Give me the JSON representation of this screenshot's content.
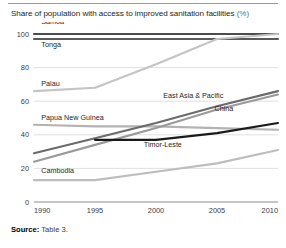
{
  "chart_data": {
    "type": "line",
    "title": "Share of population with access to improved sanitation facilities",
    "title_unit": "(%)",
    "xlabel": "",
    "ylabel": "",
    "xlim": [
      1990,
      2010
    ],
    "ylim": [
      0,
      100
    ],
    "xticks": [
      "1990",
      "1995",
      "2000",
      "2005",
      "2010"
    ],
    "yticks": [
      "0",
      "20",
      "40",
      "60",
      "80",
      "100"
    ],
    "grid": true,
    "legend_position": "inline-labels",
    "source": "Table 3.",
    "source_label": "Source:",
    "x": [
      1990,
      1995,
      2000,
      2005,
      2010
    ],
    "series": [
      {
        "name": "Samoa",
        "color": "#4c4c4c",
        "width": 2.1,
        "label_x": 1990.6,
        "label_y": 106,
        "values": [
          100,
          100,
          100,
          100,
          100
        ]
      },
      {
        "name": "Tonga",
        "color": "#5a5a5a",
        "width": 2.1,
        "label_x": 1990.6,
        "label_y": 92,
        "values": [
          97,
          97,
          97,
          97,
          97
        ]
      },
      {
        "name": "Palau",
        "color": "#c4c4c4",
        "width": 2.1,
        "label_x": 1990.6,
        "label_y": 69,
        "values": [
          66,
          68,
          82,
          97,
          100
        ]
      },
      {
        "name": "Papua New Guinea",
        "color": "#b3b3b3",
        "width": 2.1,
        "label_x": 1990.6,
        "label_y": 49,
        "values": [
          46,
          45,
          45,
          44,
          43
        ]
      },
      {
        "name": "East Asia & Pacific",
        "color": "#6b6b6b",
        "width": 2.1,
        "label_x": 2000.6,
        "label_y": 62,
        "values": [
          29,
          38,
          47,
          57,
          66
        ]
      },
      {
        "name": "China",
        "color": "#9a9a9a",
        "width": 2.1,
        "label_x": 2004.8,
        "label_y": 54,
        "values": [
          24,
          34,
          44,
          55,
          64
        ]
      },
      {
        "name": "Timor-Leste",
        "color": "#1a1a1a",
        "width": 2.1,
        "label_x": 1999.0,
        "label_y": 33,
        "values": [
          null,
          37,
          37,
          41,
          47
        ]
      },
      {
        "name": "Cambodia",
        "color": "#bdbdbd",
        "width": 2.1,
        "label_x": 1990.6,
        "label_y": 17,
        "values": [
          13,
          13,
          18,
          23,
          31
        ]
      }
    ]
  }
}
